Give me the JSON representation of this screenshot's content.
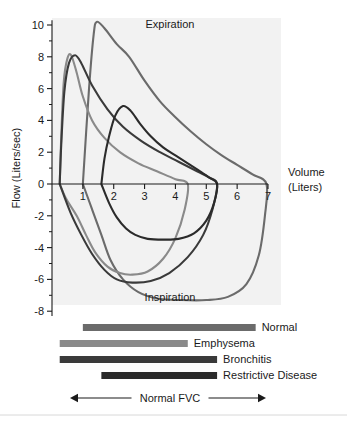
{
  "figure": {
    "title": "",
    "background_color": "#ffffff",
    "plot_background_color": "#f2f2f2"
  },
  "axes": {
    "y_axis_title": "Flow (Liters/sec)",
    "x_axis_title_line1": "Volume",
    "x_axis_title_line2": "(Liters)",
    "y_ticks": [
      "10",
      "8",
      "6",
      "4",
      "2",
      "0",
      "-2",
      "-4",
      "-6",
      "-8"
    ],
    "y_tick_values": [
      10,
      8,
      6,
      4,
      2,
      0,
      -2,
      -4,
      -6,
      -8
    ],
    "x_ticks": [
      "1",
      "2",
      "3",
      "4",
      "5",
      "6",
      "7"
    ],
    "x_tick_values": [
      1,
      2,
      3,
      4,
      5,
      6,
      7
    ],
    "ylim": [
      -8,
      10.5
    ],
    "xlim": [
      0,
      7
    ]
  },
  "annotations": {
    "expiration": "Expiration",
    "inspiration": "Inspiration",
    "normal_fvc": "Normal FVC"
  },
  "legend": {
    "items": [
      {
        "label": "Normal",
        "color": "#6b6b6b",
        "start_volume": 1.0,
        "end_volume": 6.6
      },
      {
        "label": "Emphysema",
        "color": "#8a8a8a",
        "start_volume": 0.25,
        "end_volume": 4.4
      },
      {
        "label": "Bronchitis",
        "color": "#3a3a3a",
        "start_volume": 0.25,
        "end_volume": 5.35
      },
      {
        "label": "Restrictive Disease",
        "color": "#2b2b2b",
        "start_volume": 1.6,
        "end_volume": 5.35
      }
    ]
  },
  "chart_data": {
    "type": "line",
    "title": "",
    "xlabel": "Volume (Liters)",
    "ylabel": "Flow (Liters/sec)",
    "xlim": [
      0,
      7
    ],
    "ylim": [
      -8,
      10.5
    ],
    "grid": false,
    "legend_position": "below-plot",
    "annotations": [
      "Expiration",
      "Inspiration",
      "Normal FVC"
    ],
    "series": [
      {
        "name": "Normal",
        "color": "#6b6b6b",
        "peak_expiratory_flow": 10.2,
        "peak_expiratory_volume": 1.45,
        "peak_inspiratory_flow": -7.3,
        "peak_inspiratory_volume": 4.1,
        "fvc_start_volume": 1.0,
        "fvc_end_volume": 6.95,
        "expiratory_points": [
          [
            1.0,
            0.0
          ],
          [
            1.2,
            6.0
          ],
          [
            1.35,
            9.4
          ],
          [
            1.45,
            10.2
          ],
          [
            1.7,
            9.8
          ],
          [
            2.1,
            8.8
          ],
          [
            2.5,
            8.0
          ],
          [
            3.0,
            6.5
          ],
          [
            3.5,
            5.2
          ],
          [
            4.0,
            4.2
          ],
          [
            4.5,
            3.3
          ],
          [
            5.0,
            2.5
          ],
          [
            5.5,
            1.8
          ],
          [
            6.0,
            1.2
          ],
          [
            6.5,
            0.6
          ],
          [
            6.95,
            0.0
          ]
        ],
        "inspiratory_points": [
          [
            6.95,
            0.0
          ],
          [
            6.9,
            -2.0
          ],
          [
            6.7,
            -4.5
          ],
          [
            6.3,
            -6.3
          ],
          [
            5.7,
            -7.1
          ],
          [
            5.0,
            -7.3
          ],
          [
            4.2,
            -7.3
          ],
          [
            3.4,
            -7.2
          ],
          [
            2.8,
            -6.8
          ],
          [
            2.3,
            -6.0
          ],
          [
            1.9,
            -4.8
          ],
          [
            1.6,
            -3.2
          ],
          [
            1.3,
            -1.6
          ],
          [
            1.0,
            0.0
          ]
        ]
      },
      {
        "name": "Emphysema",
        "color": "#8a8a8a",
        "peak_expiratory_flow": 8.1,
        "peak_expiratory_volume": 0.55,
        "peak_inspiratory_flow": -5.7,
        "peak_inspiratory_volume": 2.6,
        "fvc_start_volume": 0.25,
        "fvc_end_volume": 4.4,
        "expiratory_points": [
          [
            0.25,
            0.0
          ],
          [
            0.3,
            3.0
          ],
          [
            0.38,
            6.4
          ],
          [
            0.5,
            7.9
          ],
          [
            0.62,
            8.1
          ],
          [
            0.8,
            7.0
          ],
          [
            1.0,
            5.5
          ],
          [
            1.3,
            4.0
          ],
          [
            1.7,
            2.9
          ],
          [
            2.2,
            2.0
          ],
          [
            2.8,
            1.3
          ],
          [
            3.4,
            0.8
          ],
          [
            4.0,
            0.3
          ],
          [
            4.4,
            0.0
          ]
        ],
        "inspiratory_points": [
          [
            4.4,
            0.0
          ],
          [
            4.3,
            -1.6
          ],
          [
            4.0,
            -3.4
          ],
          [
            3.6,
            -4.7
          ],
          [
            3.1,
            -5.5
          ],
          [
            2.6,
            -5.7
          ],
          [
            2.2,
            -5.6
          ],
          [
            1.8,
            -5.2
          ],
          [
            1.4,
            -4.3
          ],
          [
            1.1,
            -3.2
          ],
          [
            0.8,
            -2.0
          ],
          [
            0.45,
            -0.9
          ],
          [
            0.25,
            0.0
          ]
        ]
      },
      {
        "name": "Bronchitis",
        "color": "#3a3a3a",
        "peak_expiratory_flow": 8.1,
        "peak_expiratory_volume": 0.72,
        "peak_inspiratory_flow": -6.2,
        "peak_inspiratory_volume": 2.35,
        "fvc_start_volume": 0.25,
        "fvc_end_volume": 5.35,
        "expiratory_points": [
          [
            0.25,
            0.0
          ],
          [
            0.3,
            2.5
          ],
          [
            0.4,
            5.8
          ],
          [
            0.55,
            7.6
          ],
          [
            0.75,
            8.1
          ],
          [
            0.95,
            7.6
          ],
          [
            1.3,
            6.2
          ],
          [
            1.8,
            4.7
          ],
          [
            2.3,
            3.6
          ],
          [
            2.9,
            2.7
          ],
          [
            3.5,
            2.0
          ],
          [
            4.1,
            1.4
          ],
          [
            4.7,
            0.8
          ],
          [
            5.1,
            0.4
          ],
          [
            5.35,
            0.0
          ]
        ],
        "inspiratory_points": [
          [
            5.35,
            0.0
          ],
          [
            5.2,
            -1.6
          ],
          [
            4.9,
            -3.2
          ],
          [
            4.4,
            -4.6
          ],
          [
            3.8,
            -5.6
          ],
          [
            3.2,
            -6.1
          ],
          [
            2.6,
            -6.2
          ],
          [
            2.1,
            -6.0
          ],
          [
            1.7,
            -5.4
          ],
          [
            1.3,
            -4.4
          ],
          [
            0.95,
            -3.2
          ],
          [
            0.6,
            -1.8
          ],
          [
            0.25,
            0.0
          ]
        ]
      },
      {
        "name": "Restrictive Disease",
        "color": "#2b2b2b",
        "peak_expiratory_flow": 4.9,
        "peak_expiratory_volume": 2.3,
        "peak_inspiratory_flow": -3.5,
        "peak_inspiratory_volume": 3.5,
        "fvc_start_volume": 1.6,
        "fvc_end_volume": 5.35,
        "expiratory_points": [
          [
            1.6,
            0.0
          ],
          [
            1.7,
            1.6
          ],
          [
            1.85,
            3.0
          ],
          [
            2.05,
            4.3
          ],
          [
            2.3,
            4.9
          ],
          [
            2.55,
            4.6
          ],
          [
            2.85,
            3.8
          ],
          [
            3.2,
            3.0
          ],
          [
            3.6,
            2.3
          ],
          [
            4.0,
            1.8
          ],
          [
            4.4,
            1.3
          ],
          [
            4.8,
            0.8
          ],
          [
            5.1,
            0.4
          ],
          [
            5.35,
            0.0
          ]
        ],
        "inspiratory_points": [
          [
            5.35,
            0.0
          ],
          [
            5.25,
            -1.2
          ],
          [
            5.0,
            -2.3
          ],
          [
            4.6,
            -3.1
          ],
          [
            4.1,
            -3.45
          ],
          [
            3.6,
            -3.5
          ],
          [
            3.1,
            -3.45
          ],
          [
            2.7,
            -3.2
          ],
          [
            2.4,
            -2.8
          ],
          [
            2.1,
            -2.1
          ],
          [
            1.85,
            -1.2
          ],
          [
            1.6,
            0.0
          ]
        ]
      }
    ]
  }
}
